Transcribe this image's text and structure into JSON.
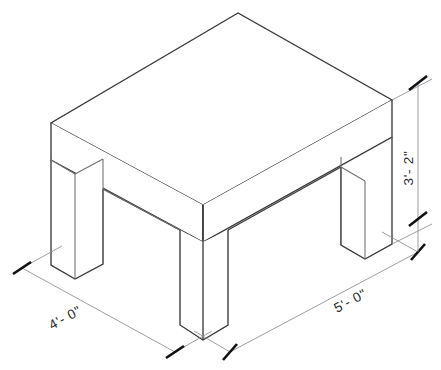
{
  "drawing": {
    "title": "Isometric table dimension drawing",
    "subject": "table",
    "line_color": "#3a3a3a",
    "soft_line_color": "#6e6e72",
    "dimension_line_color": "#8c8c92",
    "tick_color": "#111114",
    "text_color": "#2b2b2f",
    "background_color": "#ffffff"
  },
  "dimensions": {
    "width": {
      "label": "4'- 0\"",
      "name": "width-dimension",
      "feet": 4,
      "inches": 0,
      "orientation": "left-front-edge"
    },
    "length": {
      "label": "5'- 0\"",
      "name": "length-dimension",
      "feet": 5,
      "inches": 0,
      "orientation": "right-front-edge"
    },
    "height": {
      "label": "3'- 2\"",
      "name": "height-dimension",
      "feet": 3,
      "inches": 2,
      "orientation": "vertical-right"
    }
  },
  "parts": [
    {
      "name": "table-top",
      "label": "Table top"
    },
    {
      "name": "front-left-leg",
      "label": "Front left leg"
    },
    {
      "name": "front-corner-leg",
      "label": "Front corner leg"
    },
    {
      "name": "right-leg",
      "label": "Right leg"
    },
    {
      "name": "left-apron",
      "label": "Left apron"
    },
    {
      "name": "right-apron",
      "label": "Right apron"
    }
  ]
}
